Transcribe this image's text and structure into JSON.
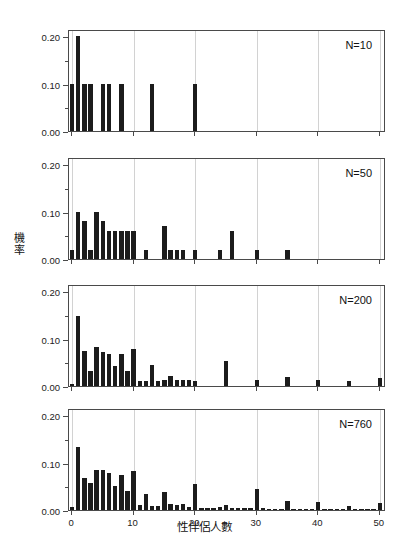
{
  "chart_data": {
    "type": "bar",
    "title": "",
    "xlabel": "性伴侶人數",
    "ylabel": "機率",
    "xlim": [
      -0.5,
      51
    ],
    "ylim": [
      0.0,
      0.215
    ],
    "grid": "vertical-only",
    "legend": "none",
    "x_ticks": [
      0,
      10,
      20,
      30,
      40,
      50
    ],
    "x_tick_labels": [
      "0",
      "10",
      "20",
      "30",
      "40",
      "50"
    ],
    "y_ticks": [
      0.0,
      0.1,
      0.2
    ],
    "y_tick_labels": [
      "0.00",
      "0.10",
      "0.20"
    ],
    "y_minor_ticks": [
      0.05,
      0.15
    ],
    "bar_color": "#1c1c1c",
    "panels": [
      {
        "annotation": "N=10",
        "x": [
          0,
          1,
          2,
          3,
          5,
          6,
          8,
          13,
          20
        ],
        "values": [
          0.1,
          0.2,
          0.1,
          0.1,
          0.1,
          0.1,
          0.1,
          0.1,
          0.1
        ]
      },
      {
        "annotation": "N=50",
        "x": [
          0,
          1,
          2,
          3,
          4,
          5,
          6,
          7,
          8,
          9,
          10,
          12,
          15,
          16,
          17,
          18,
          20,
          24,
          26,
          30,
          35
        ],
        "values": [
          0.02,
          0.1,
          0.08,
          0.02,
          0.1,
          0.08,
          0.06,
          0.06,
          0.06,
          0.06,
          0.06,
          0.02,
          0.07,
          0.02,
          0.02,
          0.02,
          0.02,
          0.02,
          0.06,
          0.02,
          0.02
        ]
      },
      {
        "annotation": "N=200",
        "x": [
          0,
          1,
          2,
          3,
          4,
          5,
          6,
          7,
          8,
          9,
          10,
          11,
          12,
          13,
          14,
          15,
          16,
          17,
          18,
          19,
          20,
          25,
          30,
          35,
          40,
          45,
          50
        ],
        "values": [
          0.005,
          0.148,
          0.073,
          0.031,
          0.082,
          0.072,
          0.068,
          0.042,
          0.068,
          0.031,
          0.079,
          0.01,
          0.01,
          0.044,
          0.01,
          0.012,
          0.022,
          0.012,
          0.012,
          0.012,
          0.01,
          0.052,
          0.013,
          0.02,
          0.012,
          0.01,
          0.017
        ]
      },
      {
        "annotation": "N=760",
        "x": [
          0,
          1,
          2,
          3,
          4,
          5,
          6,
          7,
          8,
          9,
          10,
          11,
          12,
          13,
          14,
          15,
          16,
          17,
          18,
          19,
          20,
          21,
          22,
          23,
          24,
          25,
          26,
          27,
          28,
          29,
          30,
          31,
          32,
          33,
          34,
          35,
          36,
          37,
          38,
          39,
          40,
          41,
          42,
          43,
          44,
          45,
          46,
          47,
          48,
          49,
          50
        ],
        "values": [
          0.007,
          0.133,
          0.068,
          0.057,
          0.084,
          0.085,
          0.079,
          0.05,
          0.073,
          0.04,
          0.083,
          0.01,
          0.034,
          0.009,
          0.009,
          0.038,
          0.012,
          0.01,
          0.013,
          0.006,
          0.055,
          0.005,
          0.005,
          0.005,
          0.006,
          0.011,
          0.005,
          0.004,
          0.004,
          0.004,
          0.045,
          0.004,
          0.003,
          0.003,
          0.003,
          0.018,
          0.003,
          0.003,
          0.003,
          0.003,
          0.016,
          0.003,
          0.003,
          0.003,
          0.003,
          0.009,
          0.003,
          0.003,
          0.003,
          0.003,
          0.014
        ]
      }
    ]
  }
}
